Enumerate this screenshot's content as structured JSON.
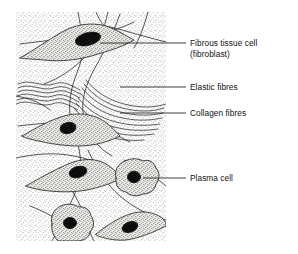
{
  "figure": {
    "name": "fibrous-connective-tissue-diagram",
    "ink_color": "#1a1a1a",
    "stipple_color": "#9a9a9a",
    "nucleus_color": "#0d0d0d",
    "cytoplasm_color": "#c8c4bc",
    "background_color": "#ffffff"
  },
  "labels": [
    {
      "id": "fibroblast",
      "line1": "Fibrous tissue cell",
      "line2": "(fibroblast)"
    },
    {
      "id": "elastic",
      "line1": "Elastic fibres",
      "line2": ""
    },
    {
      "id": "collagen",
      "line1": "Collagen fibres",
      "line2": ""
    },
    {
      "id": "plasma",
      "line1": "Plasma cell",
      "line2": ""
    }
  ],
  "structures": {
    "fibroblasts": 4,
    "plasma_cells": 2,
    "collagen_bundles": 2,
    "elastic_fibre_strands": 6
  }
}
